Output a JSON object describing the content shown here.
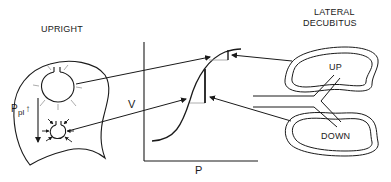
{
  "diagram": {
    "left_panel": {
      "title": "UPRIGHT",
      "pressure_label": "P",
      "pressure_subscript": "pl",
      "pressure_arrow": "↑"
    },
    "center_graph": {
      "y_axis_label": "V",
      "x_axis_label": "P",
      "curve": "sigmoid pressure-volume curve"
    },
    "right_panel": {
      "title_line1": "LATERAL",
      "title_line2": "DECUBITUS",
      "upper_lung_label": "UP",
      "lower_lung_label": "DOWN"
    },
    "colors": {
      "line": "#1a1a1a",
      "background": "#ffffff"
    }
  }
}
